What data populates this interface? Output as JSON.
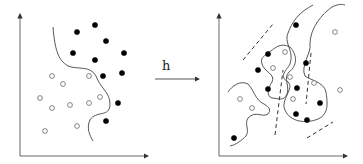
{
  "diagram": {
    "mapping_label": "h",
    "colors": {
      "stroke": "#333333",
      "filled_point": "#000000",
      "open_point_fill": "#ffffff"
    },
    "left_panel": {
      "name": "input-space",
      "filled_points": [
        [
          77,
          32
        ],
        [
          95,
          25
        ],
        [
          106,
          41
        ],
        [
          73,
          53
        ],
        [
          95,
          60
        ],
        [
          124,
          53
        ],
        [
          103,
          76
        ],
        [
          122,
          73
        ],
        [
          118,
          103
        ],
        [
          106,
          121
        ]
      ],
      "open_points": [
        [
          52,
          76
        ],
        [
          63,
          84
        ],
        [
          89,
          76
        ],
        [
          40,
          98
        ],
        [
          52,
          108
        ],
        [
          70,
          105
        ],
        [
          89,
          103
        ],
        [
          100,
          97
        ],
        [
          45,
          131
        ],
        [
          77,
          126
        ]
      ],
      "boundary": "M53,27 C55,50 58,60 68,66 C78,70 90,65 96,76 C100,88 110,92 110,104 C110,118 96,110 90,120 C86,128 90,136 93,141"
    },
    "right_panel": {
      "name": "feature-space",
      "filled_points": [
        [
          296,
          25
        ],
        [
          268,
          54
        ],
        [
          258,
          70
        ],
        [
          306,
          63
        ],
        [
          268,
          89
        ],
        [
          297,
          88
        ],
        [
          320,
          103
        ],
        [
          296,
          114
        ],
        [
          307,
          120
        ],
        [
          234,
          138
        ]
      ],
      "open_points": [
        [
          285,
          52
        ],
        [
          273,
          68
        ],
        [
          290,
          77
        ],
        [
          314,
          83
        ],
        [
          340,
          90
        ],
        [
          240,
          99
        ],
        [
          252,
          108
        ],
        [
          293,
          99
        ],
        [
          335,
          32
        ]
      ],
      "boundaries": [
        "M313,5 C300,12 292,20 287,36 C286,46 294,52 290,64 C287,70 278,76 288,82 C295,88 280,100 285,110 C290,122 306,124 318,119 C330,114 327,100 326,92 C324,82 310,80 305,76 C300,66 312,52 310,44 C310,28 322,14 332,7 C338,4 342,4 345,5",
        "M267,54 C275,48 280,42 290,47 C298,56 297,66 289,72 C283,78 290,86 287,94 C284,102 277,98 272,98 C266,96 268,88 272,82 C276,74 264,72 262,64 C260,58 264,56 267,54",
        "M228,92 C232,86 240,80 248,84 C254,90 255,100 264,104 C270,108 271,110 268,114 C262,118 256,110 248,118 C244,124 250,130 246,136 C242,140 236,145 230,146"
      ],
      "dashed_lines": [
        [
          [
            243,
            60
          ],
          [
            273,
            24
          ]
        ],
        [
          [
            275,
            135
          ],
          [
            283,
            70
          ]
        ],
        [
          [
            311,
            53
          ],
          [
            306,
            104
          ]
        ],
        [
          [
            307,
            138
          ],
          [
            333,
            122
          ]
        ]
      ]
    }
  }
}
